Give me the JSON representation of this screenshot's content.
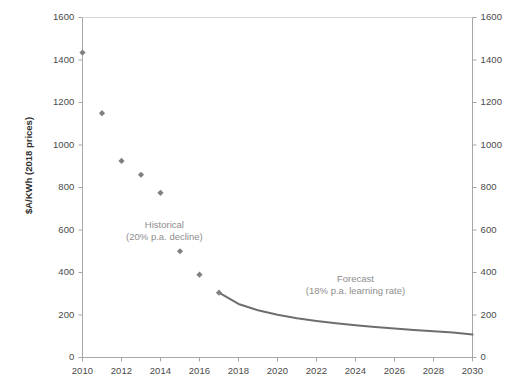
{
  "chart_data": {
    "type": "scatter",
    "title": "",
    "xlabel": "",
    "ylabel": "$A/KWh (2018 prices)",
    "xlim": [
      2010,
      2030
    ],
    "ylim": [
      0,
      1600
    ],
    "xticks": [
      2010,
      2012,
      2014,
      2016,
      2018,
      2020,
      2022,
      2024,
      2026,
      2028,
      2030
    ],
    "yticks": [
      0,
      200,
      400,
      600,
      800,
      1000,
      1200,
      1400,
      1600
    ],
    "y_axis_right": true,
    "y_axis_right_ticks": [
      0,
      200,
      400,
      600,
      800,
      1000,
      1200,
      1400,
      1600
    ],
    "grid": false,
    "legend": "none",
    "series": [
      {
        "name": "Historical",
        "type": "scatter",
        "marker": "diamond",
        "color": "#808080",
        "x": [
          2010,
          2011,
          2012,
          2013,
          2014,
          2015,
          2016,
          2017
        ],
        "values": [
          1435,
          1150,
          925,
          860,
          775,
          500,
          390,
          305
        ]
      },
      {
        "name": "Forecast",
        "type": "line",
        "color": "#6e6e6e",
        "x": [
          2017,
          2018,
          2019,
          2020,
          2021,
          2022,
          2023,
          2024,
          2025,
          2026,
          2027,
          2028,
          2029,
          2030
        ],
        "values": [
          305,
          252,
          222,
          201,
          185,
          172,
          161,
          152,
          144,
          137,
          130,
          124,
          118,
          108
        ]
      }
    ],
    "annotations": [
      {
        "name": "historical-annotation",
        "line1": "Historical",
        "line2": "(20% p.a. decline)",
        "x": 2014.2,
        "y": 620
      },
      {
        "name": "forecast-annotation",
        "line1": "Forecast",
        "line2": "(18% p.a. learning rate)",
        "x": 2024.0,
        "y": 365
      }
    ]
  },
  "axes": {
    "y_left_labels": [
      "1600",
      "1400",
      "1200",
      "1000",
      "800",
      "600",
      "400",
      "200",
      "0"
    ],
    "y_right_labels": [
      "1600",
      "1400",
      "1200",
      "1000",
      "800",
      "600",
      "400",
      "200",
      "0"
    ],
    "x_labels": [
      "2010",
      "2012",
      "2014",
      "2016",
      "2018",
      "2020",
      "2022",
      "2024",
      "2026",
      "2028",
      "2030"
    ],
    "y_axis_title": "$A/KWh (2018 prices)"
  },
  "colors": {
    "marker": "#808080",
    "line": "#6e6e6e",
    "axis": "#a6a6a6",
    "tick_text": "#4a4a4a",
    "annotation_text": "#8d8d8d",
    "background": "#ffffff"
  }
}
